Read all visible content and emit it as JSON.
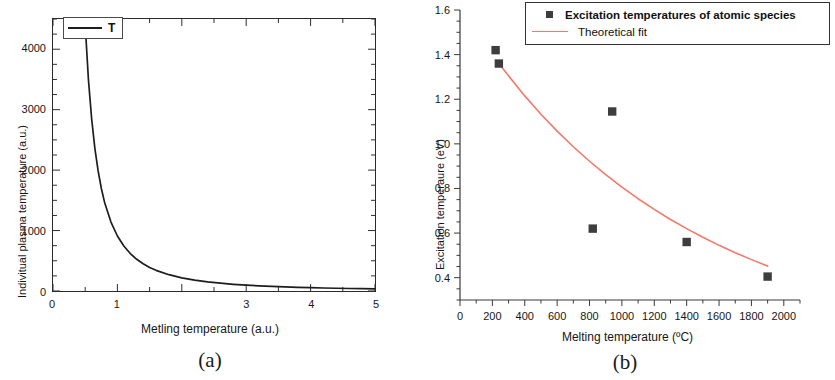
{
  "figure": {
    "panels": [
      {
        "caption": "(a)",
        "xlabel": "Metling temperature (a.u.)",
        "ylabel": "Indivitual plasma temperature (a.u.)",
        "legend_label": "T"
      },
      {
        "caption": "(b)",
        "xlabel": "Melting temperature (ºC)",
        "ylabel": "Excitation temperaure (eV)",
        "legend_series_label": "Excitation temperatures of atomic species",
        "legend_fit_label": "Theoretical fit"
      }
    ]
  },
  "chart_data": [
    {
      "type": "line",
      "panel": "(a)",
      "title": "",
      "xlabel": "Metling temperature (a.u.)",
      "ylabel": "Indivitual plasma temperature (a.u.)",
      "xlim": [
        0,
        5
      ],
      "ylim": [
        0,
        4500
      ],
      "xticks": [
        0,
        1,
        3,
        4,
        5
      ],
      "xtick_labels": [
        "0",
        "1",
        "3",
        "4",
        "5"
      ],
      "yticks": [
        0,
        1000,
        2000,
        3000,
        4000
      ],
      "ytick_labels": [
        "0",
        "1000",
        "2000",
        "3000",
        "4000"
      ],
      "grid": false,
      "frame": "box",
      "legend_position": "upper-left",
      "series": [
        {
          "name": "T",
          "color": "#1d1d1d",
          "x": [
            0.5,
            0.55,
            0.6,
            0.65,
            0.7,
            0.75,
            0.8,
            0.9,
            1.0,
            1.1,
            1.2,
            1.3,
            1.4,
            1.5,
            1.6,
            1.8,
            2.0,
            2.2,
            2.4,
            2.6,
            2.8,
            3.0,
            3.2,
            3.4,
            3.6,
            3.8,
            4.0,
            4.2,
            4.4,
            4.6,
            4.8,
            5.0
          ],
          "y": [
            4400,
            3500,
            2850,
            2360,
            1990,
            1700,
            1470,
            1140,
            910,
            745,
            620,
            525,
            450,
            390,
            342,
            270,
            218,
            180,
            151,
            129,
            111,
            97,
            85,
            76,
            67,
            61,
            55,
            50,
            45,
            41,
            38,
            35
          ]
        }
      ]
    },
    {
      "type": "scatter",
      "panel": "(b)",
      "title": "",
      "xlabel": "Melting temperature (ºC)",
      "ylabel": "Excitation temperaure (eV)",
      "xlim": [
        0,
        2100
      ],
      "ylim": [
        0.3,
        1.6
      ],
      "xticks": [
        0,
        200,
        400,
        600,
        800,
        1000,
        1200,
        1400,
        1600,
        1800,
        2000
      ],
      "xtick_labels": [
        "0",
        "200",
        "400",
        "600",
        "800",
        "1000",
        "1200",
        "1400",
        "1600",
        "1800",
        "2000"
      ],
      "yticks": [
        0.4,
        0.6,
        0.8,
        1.0,
        1.2,
        1.4,
        1.6
      ],
      "ytick_labels": [
        "0.4",
        "0.6",
        "0.8",
        "1.0",
        "1.2",
        "1.4",
        "1.6"
      ],
      "grid": false,
      "frame": "left-bottom",
      "legend_position": "upper-right",
      "series": [
        {
          "name": "Excitation temperatures of atomic species",
          "type": "scatter",
          "marker": "square",
          "color": "#3d3d3d",
          "points": [
            {
              "x": 220,
              "y": 1.42
            },
            {
              "x": 240,
              "y": 1.36
            },
            {
              "x": 820,
              "y": 0.62
            },
            {
              "x": 940,
              "y": 1.145
            },
            {
              "x": 1400,
              "y": 0.56
            },
            {
              "x": 1900,
              "y": 0.405
            }
          ]
        },
        {
          "name": "Theoretical fit",
          "type": "line",
          "color": "#f4796b",
          "x": [
            235,
            300,
            400,
            500,
            600,
            700,
            800,
            900,
            1000,
            1100,
            1200,
            1300,
            1400,
            1500,
            1600,
            1700,
            1800,
            1900
          ],
          "y": [
            1.365,
            1.305,
            1.215,
            1.133,
            1.057,
            0.987,
            0.922,
            0.862,
            0.806,
            0.754,
            0.706,
            0.661,
            0.62,
            0.581,
            0.545,
            0.512,
            0.481,
            0.452
          ]
        }
      ]
    }
  ]
}
